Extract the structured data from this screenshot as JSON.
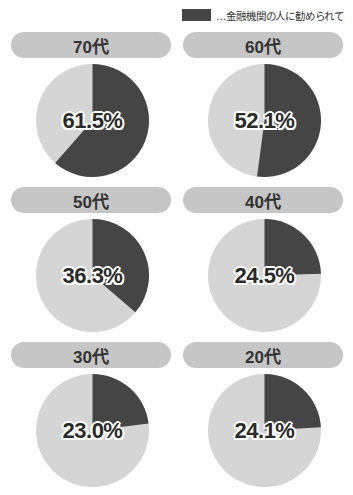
{
  "legend": {
    "label": "…金融機関の人に勧められて",
    "color": "#454545"
  },
  "colors": {
    "highlight": "#454545",
    "rest": "#d5d5d5",
    "pill": "#c6c6c6"
  },
  "panels": [
    {
      "title": "70代",
      "value": 61.5,
      "label": "61.5%"
    },
    {
      "title": "60代",
      "value": 52.1,
      "label": "52.1%"
    },
    {
      "title": "50代",
      "value": 36.3,
      "label": "36.3%"
    },
    {
      "title": "40代",
      "value": 24.5,
      "label": "24.5%"
    },
    {
      "title": "30代",
      "value": 23.0,
      "label": "23.0%"
    },
    {
      "title": "20代",
      "value": 24.1,
      "label": "24.1%"
    }
  ],
  "chart_data": {
    "type": "pie",
    "title": "",
    "legend": [
      "…金融機関の人に勧められて"
    ],
    "legend_position": "top-right",
    "categories": [
      "70代",
      "60代",
      "50代",
      "40代",
      "30代",
      "20代"
    ],
    "series": [
      {
        "name": "金融機関の人に勧められて",
        "values": [
          61.5,
          52.1,
          36.3,
          24.5,
          23.0,
          24.1
        ]
      },
      {
        "name": "その他",
        "values": [
          38.5,
          47.9,
          63.7,
          75.5,
          77.0,
          75.9
        ]
      }
    ],
    "unit": "%"
  }
}
